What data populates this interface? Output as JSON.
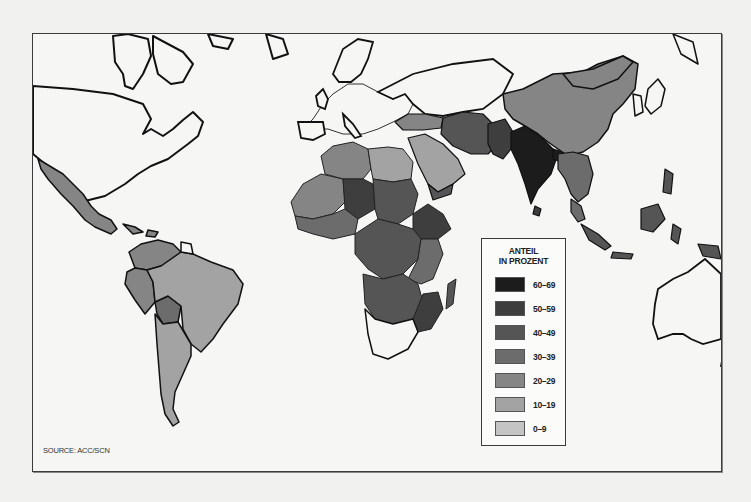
{
  "map": {
    "title": "",
    "source_label": "SOURCE: ACC/SCN",
    "legend": {
      "title_line1": "ANTEIL",
      "title_line2": "IN PROZENT",
      "items": [
        {
          "label": "60–69",
          "color": "#1c1c1c"
        },
        {
          "label": "50–59",
          "color": "#3e3e3e"
        },
        {
          "label": "40–49",
          "color": "#555555"
        },
        {
          "label": "30–39",
          "color": "#6c6c6c"
        },
        {
          "label": "20–29",
          "color": "#858585"
        },
        {
          "label": "10–19",
          "color": "#a3a3a3"
        },
        {
          "label": "0–9",
          "color": "#c4c4c4"
        }
      ]
    },
    "colors": {
      "no_data": "#f6f6f4",
      "outline": "#111111",
      "border": "#555555"
    }
  }
}
